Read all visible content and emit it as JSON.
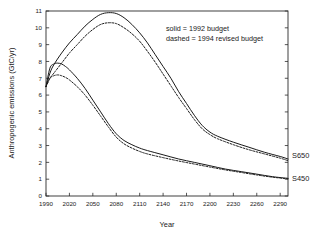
{
  "chart_data": {
    "type": "line",
    "title": "",
    "xlabel": "Year",
    "ylabel": "Anthropogenic emissions (GtC/yr)",
    "xlim": [
      1990,
      2300
    ],
    "ylim": [
      0,
      11
    ],
    "grid": false,
    "legend_position": "upper-right-inside",
    "xticks": [
      1990,
      2020,
      2050,
      2080,
      2110,
      2140,
      2170,
      2200,
      2230,
      2260,
      2290
    ],
    "xtick_labels": [
      "1990",
      "2020",
      "2050",
      "2080",
      "2110",
      "2140",
      "2170",
      "2200",
      "2230",
      "2260",
      "2290"
    ],
    "yticks": [
      0,
      1,
      2,
      3,
      4,
      5,
      6,
      7,
      8,
      9,
      10,
      11
    ],
    "ytick_labels": [
      "0",
      "1",
      "2",
      "3",
      "4",
      "5",
      "6",
      "7",
      "8",
      "9",
      "10",
      "11"
    ],
    "annotations": [
      {
        "name": "legend-solid",
        "text": "solid = 1992 budget"
      },
      {
        "name": "legend-dashed",
        "text": "dashed = 1994 revised budget"
      },
      {
        "name": "series-label-s650",
        "text": "S650"
      },
      {
        "name": "series-label-s450",
        "text": "S450"
      }
    ],
    "series": [
      {
        "name": "S650 1992 budget",
        "style": "solid",
        "scenario": "S650",
        "x": [
          1990,
          1995,
          2000,
          2010,
          2020,
          2030,
          2040,
          2050,
          2060,
          2070,
          2080,
          2090,
          2100,
          2110,
          2120,
          2130,
          2140,
          2150,
          2160,
          2170,
          2180,
          2190,
          2200,
          2210,
          2230,
          2250,
          2270,
          2290,
          2300
        ],
        "y": [
          6.5,
          7.3,
          7.8,
          8.5,
          9.1,
          9.6,
          10.1,
          10.5,
          10.8,
          10.9,
          10.85,
          10.6,
          10.2,
          9.7,
          9.1,
          8.4,
          7.7,
          7.0,
          6.2,
          5.5,
          4.8,
          4.2,
          3.8,
          3.55,
          3.2,
          2.9,
          2.6,
          2.35,
          2.2
        ]
      },
      {
        "name": "S650 1994 revised budget",
        "style": "dashed",
        "scenario": "S650",
        "x": [
          1990,
          1995,
          2000,
          2010,
          2020,
          2030,
          2040,
          2050,
          2060,
          2070,
          2080,
          2090,
          2100,
          2110,
          2120,
          2130,
          2140,
          2150,
          2160,
          2170,
          2180,
          2190,
          2200,
          2210,
          2230,
          2250,
          2270,
          2290,
          2300
        ],
        "y": [
          6.5,
          7.0,
          7.3,
          7.9,
          8.5,
          9.0,
          9.5,
          9.9,
          10.2,
          10.3,
          10.25,
          10.0,
          9.65,
          9.2,
          8.6,
          7.95,
          7.25,
          6.55,
          5.85,
          5.2,
          4.55,
          4.0,
          3.65,
          3.4,
          3.05,
          2.75,
          2.5,
          2.25,
          2.1
        ]
      },
      {
        "name": "S450 1992 budget",
        "style": "solid",
        "scenario": "S450",
        "x": [
          1990,
          1995,
          2000,
          2005,
          2010,
          2015,
          2020,
          2030,
          2040,
          2050,
          2060,
          2070,
          2080,
          2090,
          2100,
          2110,
          2120,
          2140,
          2160,
          2180,
          2200,
          2220,
          2240,
          2260,
          2280,
          2300
        ],
        "y": [
          6.5,
          7.6,
          7.85,
          7.9,
          7.85,
          7.7,
          7.5,
          7.0,
          6.4,
          5.7,
          5.0,
          4.3,
          3.7,
          3.3,
          3.05,
          2.85,
          2.7,
          2.45,
          2.2,
          2.0,
          1.8,
          1.6,
          1.45,
          1.3,
          1.15,
          1.05
        ]
      },
      {
        "name": "S450 1994 revised budget",
        "style": "dashed",
        "scenario": "S450",
        "x": [
          1990,
          1995,
          2000,
          2005,
          2010,
          2015,
          2020,
          2030,
          2040,
          2050,
          2060,
          2070,
          2080,
          2090,
          2100,
          2110,
          2120,
          2140,
          2160,
          2180,
          2200,
          2220,
          2240,
          2260,
          2280,
          2300
        ],
        "y": [
          6.5,
          7.0,
          7.15,
          7.2,
          7.15,
          7.05,
          6.9,
          6.5,
          6.0,
          5.4,
          4.75,
          4.1,
          3.5,
          3.1,
          2.85,
          2.65,
          2.5,
          2.28,
          2.08,
          1.9,
          1.72,
          1.55,
          1.4,
          1.25,
          1.12,
          1.02
        ]
      }
    ]
  }
}
